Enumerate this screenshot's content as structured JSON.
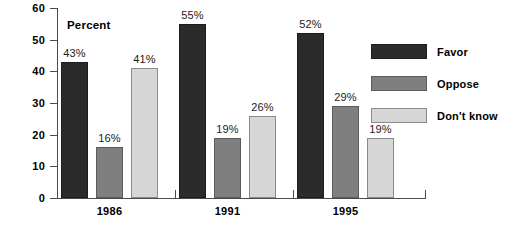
{
  "chart_data": {
    "type": "bar",
    "title": "",
    "subtitle": "",
    "xlabel": "",
    "ylabel": "Percent",
    "axis_note": "Percent",
    "categories": [
      "1986",
      "1991",
      "1995"
    ],
    "series": [
      {
        "name": "Favor",
        "color": "#2b2b2b",
        "values": [
          43,
          55,
          52
        ],
        "labels": [
          "43%",
          "55%",
          "52%"
        ]
      },
      {
        "name": "Oppose",
        "color": "#7f7f7f",
        "values": [
          16,
          19,
          29
        ],
        "labels": [
          "16%",
          "19%",
          "29%"
        ]
      },
      {
        "name": "Don't know",
        "color": "#d6d6d6",
        "values": [
          41,
          26,
          19
        ],
        "labels": [
          "41%",
          "26%",
          "19%"
        ]
      }
    ],
    "ylim": [
      0,
      60
    ],
    "yticks": [
      0,
      10,
      20,
      30,
      40,
      50,
      60
    ],
    "ytick_labels": [
      "0",
      "10",
      "20",
      "30",
      "40",
      "50",
      "60"
    ],
    "grid": false,
    "legend_position": "right",
    "value_labels": true,
    "value_label_suffix": "%"
  },
  "legend": {
    "items": [
      {
        "label": "Favor"
      },
      {
        "label": "Oppose"
      },
      {
        "label": "Don't know"
      }
    ]
  }
}
